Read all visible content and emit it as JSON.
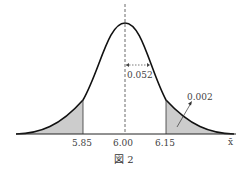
{
  "figure": {
    "caption": "図 2",
    "x_axis_label": "x̄",
    "tick_labels": [
      "5.85",
      "6.00",
      "6.15"
    ],
    "std_annotation": "0.052",
    "tail_annotation": "0.002"
  },
  "colors": {
    "curve": "#111111",
    "shade": "#cccccc",
    "axis": "#222222"
  }
}
